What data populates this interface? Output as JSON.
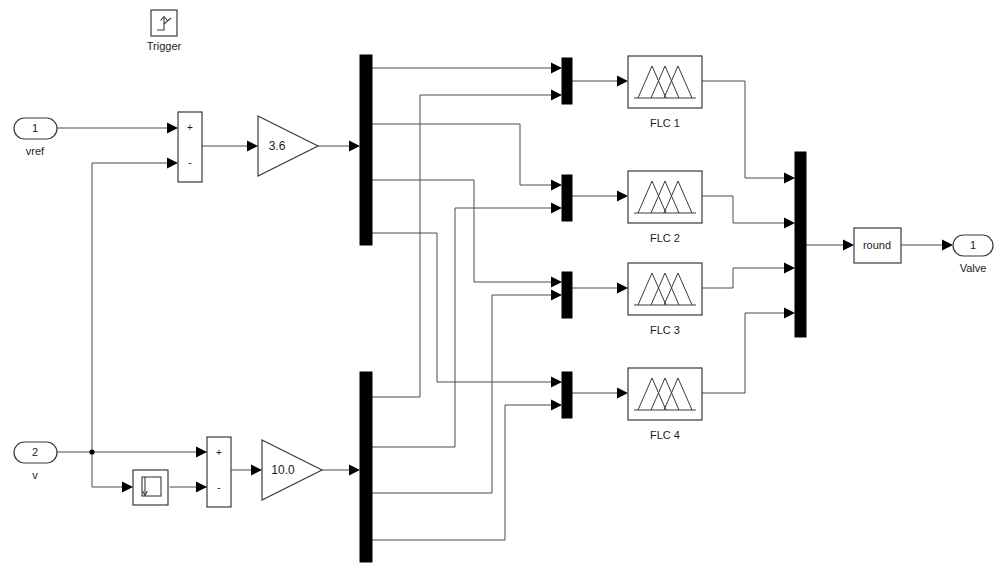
{
  "diagram": {
    "background_color": "#ffffff",
    "line_color": "#4a4a4a",
    "block_fill": "#ffffff",
    "block_stroke": "#3a3a3a",
    "bar_color": "#000000"
  },
  "trigger": {
    "name": "trigger-block",
    "label": "Trigger",
    "icon": "rising-edge-trigger-icon"
  },
  "inputs": [
    {
      "name": "inport-vref",
      "port_number": "1",
      "label": "vref",
      "icon": "inport-icon"
    },
    {
      "name": "inport-v",
      "port_number": "2",
      "label": "v",
      "icon": "inport-icon"
    }
  ],
  "outputs": [
    {
      "name": "outport-valve",
      "port_number": "1",
      "label": "Valve",
      "icon": "outport-icon"
    }
  ],
  "sum_blocks": [
    {
      "name": "sum-vref-v",
      "signs": [
        "+",
        "-"
      ]
    },
    {
      "name": "sum-v-delay",
      "signs": [
        "+",
        "-"
      ]
    }
  ],
  "gains": [
    {
      "name": "gain-upper",
      "value": "3.6"
    },
    {
      "name": "gain-lower",
      "value": "10.0"
    }
  ],
  "delay_block": {
    "name": "unit-delay-block",
    "icon": "unit-delay-icon",
    "label": ""
  },
  "demux_blocks": [
    {
      "name": "demux-upper",
      "outputs": 4
    },
    {
      "name": "demux-lower",
      "outputs": 4
    }
  ],
  "mux_blocks": [
    {
      "name": "mux-flc-1",
      "inputs": 2
    },
    {
      "name": "mux-flc-2",
      "inputs": 2
    },
    {
      "name": "mux-flc-3",
      "inputs": 2
    },
    {
      "name": "mux-flc-4",
      "inputs": 2
    },
    {
      "name": "mux-output",
      "inputs": 4
    }
  ],
  "flc_blocks": [
    {
      "name": "flc-block-1",
      "label": "FLC 1",
      "icon": "fuzzy-membership-icon"
    },
    {
      "name": "flc-block-2",
      "label": "FLC 2",
      "icon": "fuzzy-membership-icon"
    },
    {
      "name": "flc-block-3",
      "label": "FLC 3",
      "icon": "fuzzy-membership-icon"
    },
    {
      "name": "flc-block-4",
      "label": "FLC 4",
      "icon": "fuzzy-membership-icon"
    }
  ],
  "round_block": {
    "name": "round-block",
    "label": "round"
  }
}
